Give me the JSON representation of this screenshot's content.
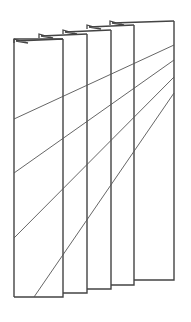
{
  "diagram": {
    "stroke_color": "#444444",
    "line_color": "#555555",
    "panels": [
      {
        "name": "back-panel",
        "x1": 110,
        "x2": 174,
        "top": 21,
        "bottom": 280
      },
      {
        "name": "panel-4",
        "x1": 87,
        "x2": 134,
        "top": 25,
        "bottom": 285
      },
      {
        "name": "panel-3",
        "x1": 63,
        "x2": 111,
        "top": 30,
        "bottom": 289
      },
      {
        "name": "panel-2",
        "x1": 39,
        "x2": 87,
        "top": 34,
        "bottom": 293
      },
      {
        "name": "front-panel",
        "x1": 14,
        "x2": 63,
        "top": 39,
        "bottom": 297
      }
    ],
    "diagonals": [
      {
        "x1": 14,
        "y1": 119,
        "x2": 174,
        "y2": 45
      },
      {
        "x1": 14,
        "y1": 173,
        "x2": 174,
        "y2": 60
      },
      {
        "x1": 14,
        "y1": 238,
        "x2": 174,
        "y2": 77
      },
      {
        "x1": 34,
        "y1": 297,
        "x2": 174,
        "y2": 93
      }
    ]
  }
}
